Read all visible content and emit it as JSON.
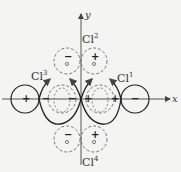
{
  "diagram": {
    "axes": {
      "x_label": "x",
      "y_label": "y"
    },
    "ligands": [
      {
        "id": "cl1",
        "label": "Cl",
        "superscript": "1"
      },
      {
        "id": "cl2",
        "label": "Cl",
        "superscript": "2"
      },
      {
        "id": "cl3",
        "label": "Cl",
        "superscript": "3"
      },
      {
        "id": "cl4",
        "label": "Cl",
        "superscript": "4"
      }
    ],
    "lobe_signs": {
      "far_left": "+",
      "center_left_outer": "−",
      "center_left_inner": "−",
      "center_right_inner": "+",
      "center_right_outer": "+",
      "far_right": "−",
      "top_left": "−",
      "top_right": "+",
      "bottom_left": "−",
      "bottom_right": "+"
    },
    "colors": {
      "line": "#222222",
      "dashed": "#666666",
      "axis": "#555555",
      "background": "#f4f4f2"
    }
  }
}
